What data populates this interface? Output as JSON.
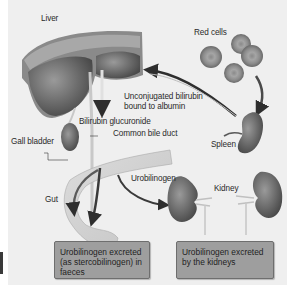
{
  "diagram": {
    "labels": {
      "liver": "Liver",
      "red_cells": "Red cells",
      "unconjugated_line1": "Unconjugated bilirubin",
      "unconjugated_line2": "bound to albumin",
      "bilirubin_glucuronide": "Bilirubin glucuronide",
      "common_bile_duct": "Common bile duct",
      "gall_bladder": "Gall bladder",
      "spleen": "Spleen",
      "gut": "Gut",
      "urobilinogen": "Urobilinogen",
      "kidney": "Kidney"
    },
    "boxes": {
      "faeces": "Urobilinogen excreted (as stercobilinogen) in faeces",
      "kidneys": "Urobilinogen excreted by the kidneys"
    },
    "colors": {
      "background": "#efefef",
      "organ": "#6f6f6f",
      "organ_dark": "#4a4a4a",
      "arrow": "#2e2e2e",
      "box": "#9e9e9e"
    }
  }
}
